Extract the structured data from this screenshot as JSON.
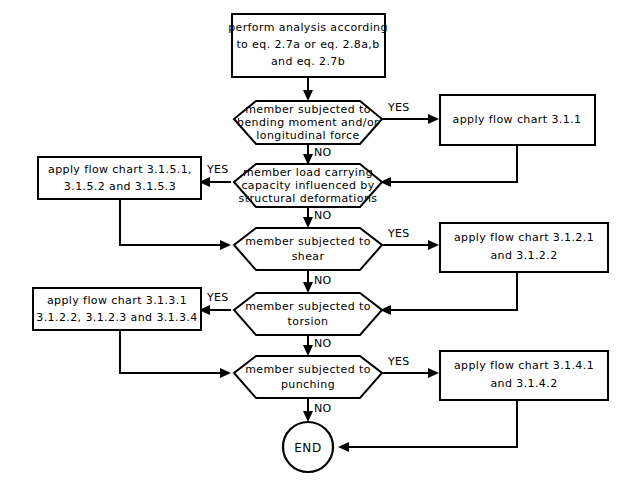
{
  "diagram": {
    "type": "flowchart",
    "background_color": "#ffffff",
    "line_color": "#000000",
    "fill_color": "#ffffff"
  },
  "nodes": {
    "start_process": {
      "shape": "process",
      "line1": "perform analysis according",
      "line2": "to eq. 2.7a or eq. 2.8a,b",
      "line3": "and eq. 2.7b"
    },
    "decision_bending": {
      "shape": "decision",
      "line1": "member subjected to",
      "line2": "bending moment and/or",
      "line3": "longitudinal force"
    },
    "action_bending": {
      "shape": "process",
      "line1": "apply flow chart 3.1.1"
    },
    "decision_deformations": {
      "shape": "decision",
      "line1": "member load carrying",
      "line2": "capacity influenced by",
      "line3": "structural deformations"
    },
    "action_deformations": {
      "shape": "process",
      "line1": "apply flow chart 3.1.5.1,",
      "line2": "3.1.5.2 and 3.1.5.3"
    },
    "decision_shear": {
      "shape": "decision",
      "line1": "member subjected to",
      "line2": "shear"
    },
    "action_shear": {
      "shape": "process",
      "line1": "apply flow chart 3.1.2.1",
      "line2": "and 3.1.2.2"
    },
    "decision_torsion": {
      "shape": "decision",
      "line1": "member subjected to",
      "line2": "torsion"
    },
    "action_torsion": {
      "shape": "process",
      "line1": "apply flow chart 3.1.3.1",
      "line2": "3.1.2.2, 3.1.2.3 and 3.1.3.4"
    },
    "decision_punching": {
      "shape": "decision",
      "line1": "member subjected to",
      "line2": "punching"
    },
    "action_punching": {
      "shape": "process",
      "line1": "apply flow chart 3.1.4.1",
      "line2": "and 3.1.4.2"
    },
    "end_terminal": {
      "shape": "terminator",
      "label": "END"
    }
  },
  "edge_labels": {
    "bending_yes": "YES",
    "bending_no": "NO",
    "deformations_yes": "YES",
    "deformations_no": "NO",
    "shear_yes": "YES",
    "shear_no": "NO",
    "torsion_yes": "YES",
    "torsion_no": "NO",
    "punching_yes": "YES",
    "punching_no": "NO"
  }
}
